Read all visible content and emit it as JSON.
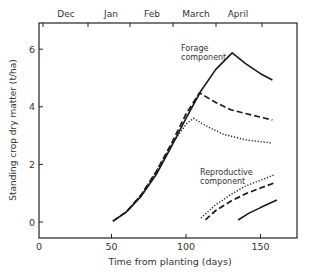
{
  "chart_data": {
    "type": "line",
    "title": "",
    "xlabel": "Time from planting (days)",
    "ylabel": "Standing crop dry matter (t/ha)",
    "xlim": [
      0,
      175
    ],
    "ylim": [
      -0.5,
      6.5
    ],
    "xticks": [
      0,
      50,
      100,
      150
    ],
    "yticks": [
      0,
      2,
      4,
      6
    ],
    "top_axis_months": [
      "Dec",
      "Jan",
      "Feb",
      "March",
      "April"
    ],
    "grid": false,
    "annotations": [
      {
        "text": "Forage component",
        "x": 105,
        "y": 5.9
      },
      {
        "text": "Reproductive component",
        "x": 113,
        "y": 1.6
      }
    ],
    "series": [
      {
        "name": "Forage (solid)",
        "style": "solid",
        "points": [
          [
            51,
            0.03
          ],
          [
            60,
            0.35
          ],
          [
            70,
            0.9
          ],
          [
            80,
            1.65
          ],
          [
            90,
            2.6
          ],
          [
            100,
            3.6
          ],
          [
            110,
            4.55
          ],
          [
            120,
            5.3
          ],
          [
            131,
            5.87
          ],
          [
            140,
            5.5
          ],
          [
            150,
            5.15
          ],
          [
            158,
            4.93
          ]
        ]
      },
      {
        "name": "Forage (dashed)",
        "style": "dashed",
        "points": [
          [
            51,
            0.03
          ],
          [
            60,
            0.35
          ],
          [
            70,
            0.95
          ],
          [
            80,
            1.75
          ],
          [
            90,
            2.7
          ],
          [
            100,
            3.75
          ],
          [
            109,
            4.48
          ],
          [
            120,
            4.15
          ],
          [
            130,
            3.9
          ],
          [
            145,
            3.7
          ],
          [
            158,
            3.54
          ]
        ]
      },
      {
        "name": "Forage (dotted)",
        "style": "dotted",
        "points": [
          [
            51,
            0.03
          ],
          [
            60,
            0.35
          ],
          [
            70,
            0.95
          ],
          [
            80,
            1.75
          ],
          [
            90,
            2.65
          ],
          [
            100,
            3.4
          ],
          [
            105,
            3.6
          ],
          [
            115,
            3.3
          ],
          [
            125,
            3.05
          ],
          [
            140,
            2.85
          ],
          [
            158,
            2.74
          ]
        ]
      },
      {
        "name": "Reproductive (dotted)",
        "style": "dotted",
        "points": [
          [
            110,
            0.14
          ],
          [
            120,
            0.6
          ],
          [
            130,
            0.95
          ],
          [
            140,
            1.25
          ],
          [
            150,
            1.45
          ],
          [
            159,
            1.63
          ]
        ]
      },
      {
        "name": "Reproductive (dashed)",
        "style": "dashed",
        "points": [
          [
            113,
            0.07
          ],
          [
            120,
            0.4
          ],
          [
            130,
            0.72
          ],
          [
            140,
            0.98
          ],
          [
            150,
            1.18
          ],
          [
            159,
            1.35
          ]
        ]
      },
      {
        "name": "Reproductive (solid)",
        "style": "solid",
        "points": [
          [
            135,
            0.07
          ],
          [
            142,
            0.3
          ],
          [
            150,
            0.5
          ],
          [
            161,
            0.76
          ]
        ]
      }
    ]
  }
}
